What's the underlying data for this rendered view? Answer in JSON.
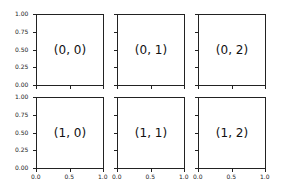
{
  "chart_data": {
    "type": "subplots-grid",
    "rows": 2,
    "cols": 3,
    "sharex": true,
    "sharey": true,
    "panels": [
      {
        "row": 0,
        "col": 0,
        "label": "(0, 0)"
      },
      {
        "row": 0,
        "col": 1,
        "label": "(0, 1)"
      },
      {
        "row": 0,
        "col": 2,
        "label": "(0, 2)"
      },
      {
        "row": 1,
        "col": 0,
        "label": "(1, 0)"
      },
      {
        "row": 1,
        "col": 1,
        "label": "(1, 1)"
      },
      {
        "row": 1,
        "col": 2,
        "label": "(1, 2)"
      }
    ],
    "xlim": [
      0,
      1
    ],
    "ylim": [
      0,
      1
    ],
    "xticks": [
      "0.0",
      "0.5",
      "1.0"
    ],
    "yticks": [
      "0.00",
      "0.25",
      "0.50",
      "0.75",
      "1.00"
    ],
    "title": "",
    "xlabel": "",
    "ylabel": ""
  }
}
